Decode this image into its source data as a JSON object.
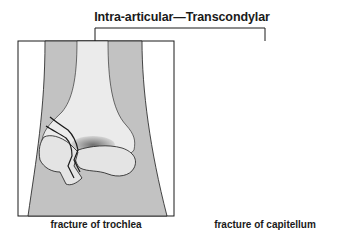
{
  "diagram": {
    "title": "Intra-articular—Transcondylar",
    "panels": [
      {
        "id": "trochlea",
        "caption": "fracture of trochlea"
      },
      {
        "id": "capitellum",
        "caption": "fracture of capitellum"
      }
    ],
    "colors": {
      "soft_tissue": "#c2c2c2",
      "bone": "#ebebeb",
      "bone_fragment": "#e4e4e4",
      "outline": "#1a1a1a",
      "background": "#ffffff",
      "shading": "#8a8a8a"
    }
  }
}
